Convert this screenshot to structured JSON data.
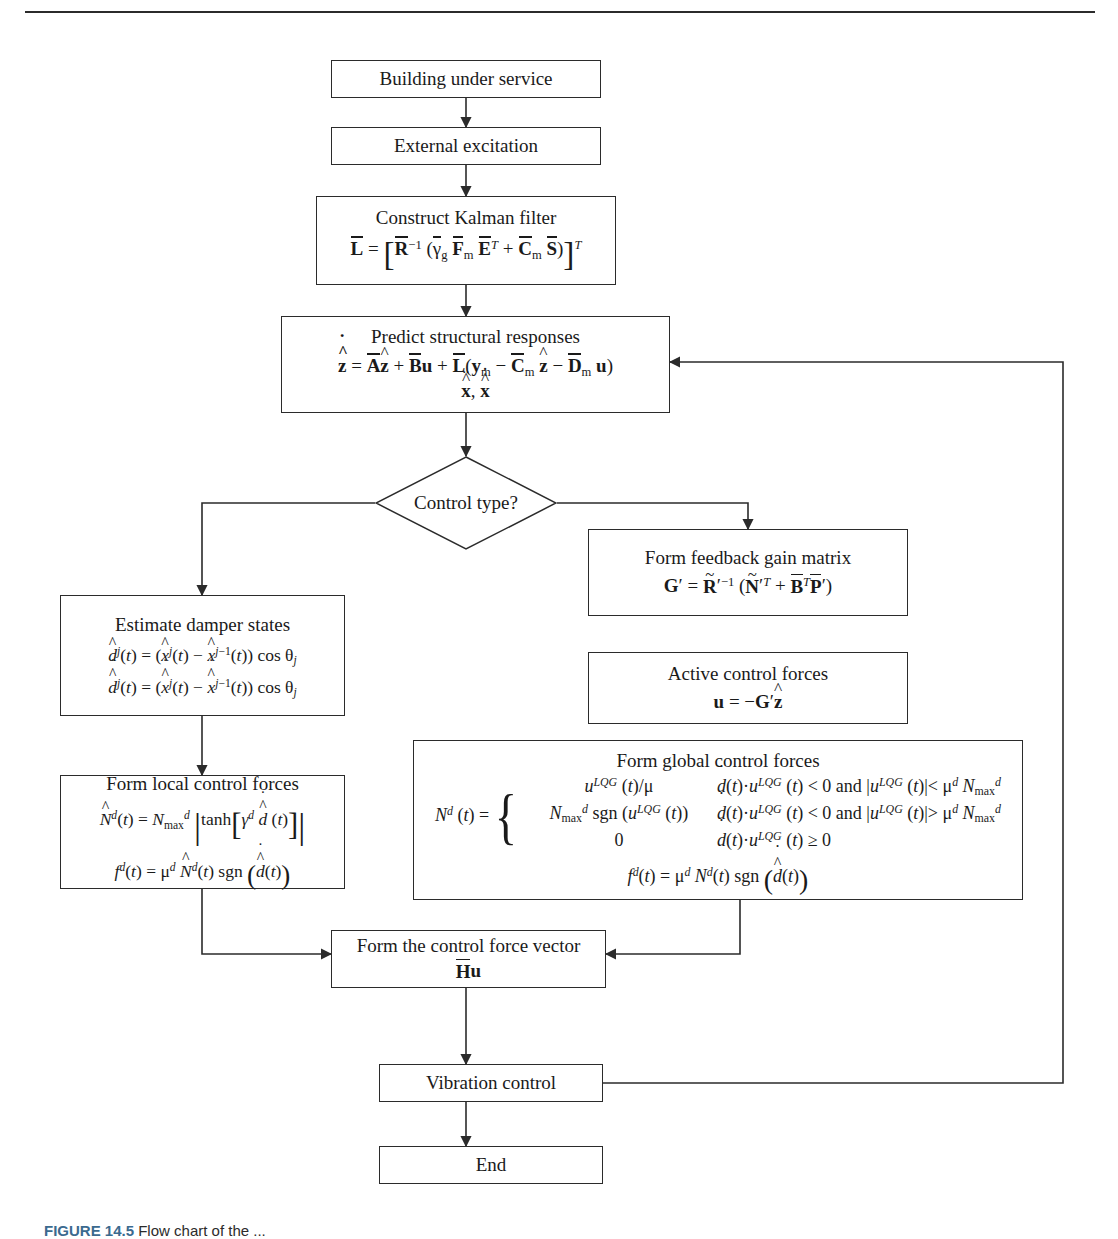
{
  "figure": {
    "caption_label": "FIGURE 14.5",
    "caption_text": "Flow chart of the ..."
  },
  "nodes": {
    "building": {
      "label": "Building under service"
    },
    "excitation": {
      "label": "External excitation"
    },
    "kalman": {
      "title": "Construct Kalman filter",
      "equation": "L̄ = [R̄⁻¹ (γ̄g F̄m Ēᵀ + C̄m S̄)]ᵀ"
    },
    "predict": {
      "title": "Predict structural responses",
      "equation": "ẑ̇ = Āẑ + B̄u + L̄(ym − C̄m ẑ − D̄m u)",
      "equation2": "ẍ̂, ẋ̂"
    },
    "decision": {
      "label": "Control type?"
    },
    "feedback_gain": {
      "title": "Form feedback gain matrix",
      "equation": "G′ = R̃′⁻¹ (Ñ′ᵀ + B̄ᵀP̄′)"
    },
    "active_forces": {
      "title": "Active control forces",
      "equation": "u = −G′ẑ"
    },
    "damper_states": {
      "title": "Estimate damper states",
      "equation1": "d̂ʲ(t) = (x̂ʲ(t) − x̂ʲ⁻¹(t)) cos θⱼ",
      "equation2": "d̂̇ʲ(t) = (x̂̇ʲ(t) − x̂̇ʲ⁻¹(t)) cos θⱼ"
    },
    "local_forces": {
      "title": "Form local control forces",
      "equation1": "N̂ᵈ(t) = Nᵈmax |tanh[γᵈ d̂̇(t)]|",
      "equation2": "fᵈ(t) = μᵈ N̂ᵈ(t) sgn(d̂̇(t))"
    },
    "global_forces": {
      "title": "Form global control forces",
      "lhs": "Nᵈ (t) =",
      "cases": [
        {
          "value": "uᴸᴱᴳ (t)/μ",
          "condition": "ḋ(t)·uᴸᴱᴳ (t) < 0 and |uᴸᴱᴳ (t)|< μᵈ Nᵈmax"
        },
        {
          "value": "Nᵈmax sgn (uᴸᴱᴳ (t))",
          "condition": "ḋ(t)·uᴸᴱᴳ (t) < 0 and |uᴸᴱᴳ (t)|> μᵈ Nᵈmax"
        },
        {
          "value": "0",
          "condition": "ḋ(t)·uᴸᴱᴳ (t) ≥ 0"
        }
      ],
      "last_equation": "fᵈ(t) = μᵈ Nᵈ(t) sgn(d̂̇(t))"
    },
    "force_vector": {
      "title": "Form the control force vector",
      "equation": "H̄u"
    },
    "vibration": {
      "label": "Vibration control"
    },
    "end": {
      "label": "End"
    }
  },
  "style": {
    "line_color": "#2b2b2b",
    "box_fill": "#ffffff",
    "text_color": "#1a1a1a"
  }
}
